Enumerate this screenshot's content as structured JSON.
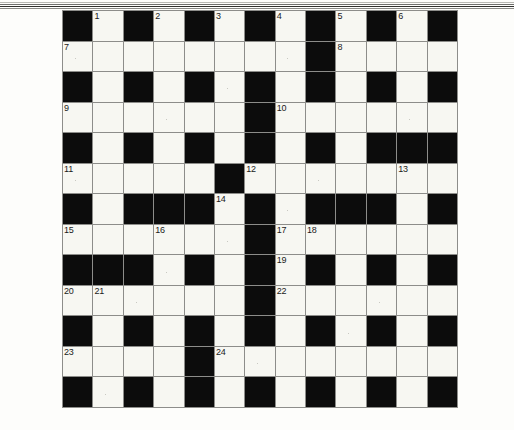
{
  "puzzle": {
    "title": "Crossword Grid",
    "rows": 13,
    "columns": 13,
    "cell_colors": {
      "white": "#f7f7f2",
      "black": "#0c0c0c",
      "grid_line": "#8d8d8a"
    },
    "numbers_total": 24,
    "layout_note": "13x13 black-and-white crossword grid, numbers 1 through 24",
    "grid": [
      [
        "#",
        "1",
        "#",
        "2",
        "#",
        "3",
        "#",
        "4",
        "#",
        "5",
        "#",
        "6",
        "#"
      ],
      [
        "7",
        ".",
        ".",
        ".",
        ".",
        ".",
        ".",
        ".",
        "#",
        "8",
        ".",
        ".",
        "."
      ],
      [
        "#",
        ".",
        "#",
        ".",
        "#",
        ".",
        "#",
        ".",
        "#",
        ".",
        "#",
        ".",
        "#"
      ],
      [
        "9",
        ".",
        ".",
        ".",
        ".",
        ".",
        "#",
        "10",
        ".",
        ".",
        ".",
        ".",
        "."
      ],
      [
        "#",
        ".",
        "#",
        ".",
        "#",
        ".",
        "#",
        ".",
        "#",
        ".",
        "#",
        "#",
        "#"
      ],
      [
        "11",
        ".",
        ".",
        ".",
        ".",
        "#",
        "12",
        ".",
        ".",
        ".",
        ".",
        "13",
        "."
      ],
      [
        "#",
        ".",
        "#",
        "#",
        "#",
        "14",
        "#",
        ".",
        "#",
        "#",
        "#",
        ".",
        "#"
      ],
      [
        "15",
        ".",
        ".",
        "16",
        ".",
        ".",
        "#",
        "17",
        "18",
        ".",
        ".",
        ".",
        "."
      ],
      [
        "#",
        "#",
        "#",
        ".",
        "#",
        ".",
        "#",
        "19",
        "#",
        ".",
        "#",
        ".",
        "#"
      ],
      [
        "20",
        "21",
        ".",
        ".",
        ".",
        ".",
        "#",
        "22",
        ".",
        ".",
        ".",
        ".",
        "."
      ],
      [
        "#",
        ".",
        "#",
        ".",
        "#",
        ".",
        "#",
        ".",
        "#",
        ".",
        "#",
        ".",
        "#"
      ],
      [
        "23",
        ".",
        ".",
        ".",
        "#",
        "24",
        ".",
        ".",
        ".",
        ".",
        ".",
        ".",
        "."
      ],
      [
        "#",
        ".",
        "#",
        ".",
        "#",
        ".",
        "#",
        ".",
        "#",
        ".",
        "#",
        ".",
        "#"
      ]
    ],
    "clue_numbers": [
      1,
      2,
      3,
      4,
      5,
      6,
      7,
      8,
      9,
      10,
      11,
      12,
      13,
      14,
      15,
      16,
      17,
      18,
      19,
      20,
      21,
      22,
      23,
      24
    ]
  },
  "page": {
    "background": "#fdfdfb",
    "scan_artifact": "horizontal scan lines at top edge"
  }
}
